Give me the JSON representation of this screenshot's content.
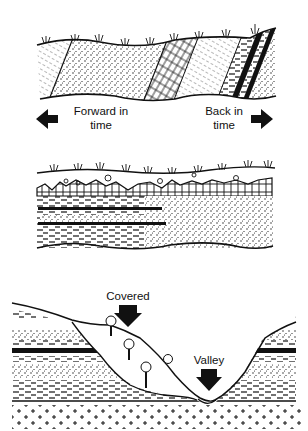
{
  "figure": {
    "panels": [
      {
        "id": "tilted-strata",
        "description": "Tilted, eroded sedimentary layers beneath soil surface with grass",
        "labels": {
          "left": "Forward in time",
          "left_line1": "Forward in",
          "left_line2": "time",
          "right": "Back in time",
          "right_line1": "Back in",
          "right_line2": "time"
        },
        "arrows": [
          "left",
          "right"
        ]
      },
      {
        "id": "horizontal-strata",
        "description": "Horizontal layered strata (shale, sandstone, coal bands) under a surface soil/brick layer with grass"
      },
      {
        "id": "valley-cross-section",
        "description": "Valley cut through horizontal strata; slope covered by colluvium with trees; basement crosses at bottom",
        "labels": {
          "covered": "Covered",
          "valley": "Valley"
        },
        "arrows": [
          "down-covered",
          "down-valley"
        ]
      }
    ],
    "colors": {
      "ink": "#111111",
      "background": "#ffffff"
    }
  }
}
